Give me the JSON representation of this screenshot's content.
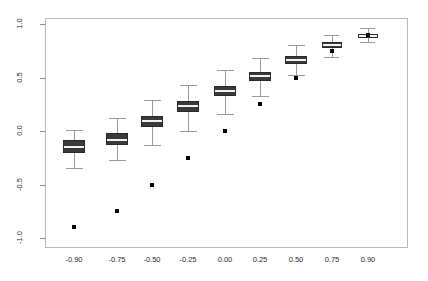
{
  "chart_data": {
    "type": "box",
    "title": "",
    "subtitle": "",
    "xlabel": "",
    "ylabel": "",
    "xlim": [
      -1.05,
      1.05
    ],
    "ylim": [
      -1.15,
      1.12
    ],
    "grid": false,
    "legend": null,
    "frame": true,
    "y_ticks": [
      {
        "value": 1.0,
        "label": "1.0"
      },
      {
        "value": 0.5,
        "label": "0.5"
      },
      {
        "value": 0.0,
        "label": "0.0"
      },
      {
        "value": -0.5,
        "label": "-0.5"
      },
      {
        "value": -1.0,
        "label": "-1.0"
      }
    ],
    "x_ticks": [
      {
        "value": -0.9,
        "label": "-0.90"
      },
      {
        "value": -0.75,
        "label": "-0.75"
      },
      {
        "value": -0.5,
        "label": "-0.50"
      },
      {
        "value": -0.25,
        "label": "-0.25"
      },
      {
        "value": 0.0,
        "label": "0.00"
      },
      {
        "value": 0.25,
        "label": "0.25"
      },
      {
        "value": 0.5,
        "label": "0.50"
      },
      {
        "value": 0.75,
        "label": "0.75"
      },
      {
        "value": 0.9,
        "label": "0.90"
      }
    ],
    "categories": [
      "-0.90",
      "-0.75",
      "-0.50",
      "-0.25",
      "0.00",
      "0.25",
      "0.50",
      "0.75",
      "0.90"
    ],
    "boxes": [
      {
        "category": "-0.90",
        "whisker_low": -0.35,
        "q1": -0.21,
        "median": -0.15,
        "q3": -0.08,
        "whisker_high": 0.01,
        "truth": -0.9
      },
      {
        "category": "-0.75",
        "whisker_low": -0.27,
        "q1": -0.13,
        "median": -0.08,
        "q3": -0.02,
        "whisker_high": 0.12,
        "truth": -0.75
      },
      {
        "category": "-0.50",
        "whisker_low": -0.13,
        "q1": 0.04,
        "median": 0.09,
        "q3": 0.14,
        "whisker_high": 0.29,
        "truth": -0.5
      },
      {
        "category": "-0.25",
        "whisker_low": 0.0,
        "q1": 0.18,
        "median": 0.23,
        "q3": 0.28,
        "whisker_high": 0.43,
        "truth": -0.25
      },
      {
        "category": "0.00",
        "whisker_low": 0.16,
        "q1": 0.33,
        "median": 0.37,
        "q3": 0.42,
        "whisker_high": 0.57,
        "truth": 0.0
      },
      {
        "category": "0.25",
        "whisker_low": 0.33,
        "q1": 0.47,
        "median": 0.51,
        "q3": 0.55,
        "whisker_high": 0.68,
        "truth": 0.25
      },
      {
        "category": "0.50",
        "whisker_low": 0.52,
        "q1": 0.63,
        "median": 0.66,
        "q3": 0.7,
        "whisker_high": 0.8,
        "truth": 0.5
      },
      {
        "category": "0.75",
        "whisker_low": 0.69,
        "q1": 0.78,
        "median": 0.8,
        "q3": 0.83,
        "whisker_high": 0.9,
        "truth": 0.75
      },
      {
        "category": "0.90",
        "whisker_low": 0.83,
        "q1": 0.87,
        "median": 0.89,
        "q3": 0.91,
        "whisker_high": 0.96,
        "truth": 0.9
      }
    ],
    "box_centers_px": [
      74,
      117,
      152,
      188,
      225,
      260,
      296,
      332,
      368
    ],
    "box_width_px": 22,
    "narrow_box_width_px": 20,
    "colors": {
      "box_fill": "#3a3a3a",
      "box_border": "#2a2a2a",
      "median": "#f2f2f2",
      "whisker": "#9a9a9a",
      "truth_dot": "#000000",
      "frame": "#b9b9b9",
      "text": "#2b2b2b",
      "background": "#ffffff"
    }
  }
}
